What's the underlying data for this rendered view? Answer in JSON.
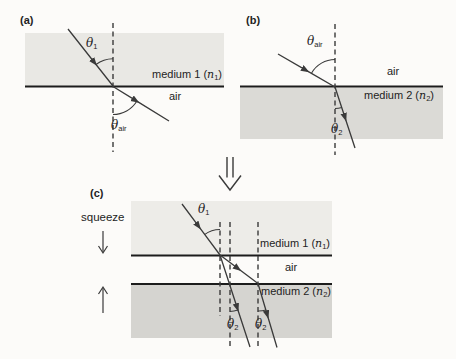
{
  "panel_a": {
    "label": "(a)",
    "theta1": {
      "sym": "θ",
      "sub": "1"
    },
    "theta_air": {
      "sym": "θ",
      "sub": "air"
    },
    "medium1": {
      "pre": "medium 1 (",
      "n": "n",
      "sub": "1",
      "post": ")"
    },
    "air": "air"
  },
  "panel_b": {
    "label": "(b)",
    "theta_air": {
      "sym": "θ",
      "sub": "air"
    },
    "theta2": {
      "sym": "θ",
      "sub": "2"
    },
    "medium2": {
      "pre": "medium 2 (",
      "n": "n",
      "sub": "2",
      "post": ")"
    },
    "air": "air"
  },
  "panel_c": {
    "label": "(c)",
    "squeeze": "squeeze",
    "theta1": {
      "sym": "θ",
      "sub": "1"
    },
    "theta2_left": {
      "sym": "θ",
      "sub": "2"
    },
    "theta2_right": {
      "sym": "θ",
      "sub": "2"
    },
    "medium1": {
      "pre": "medium 1 (",
      "n": "n",
      "sub": "1",
      "post": ")"
    },
    "medium2": {
      "pre": "medium 2 (",
      "n": "n",
      "sub": "2",
      "post": ")"
    },
    "air": "air"
  },
  "colors": {
    "background": "#fcfbf9",
    "medium1_a": "#e9e8e4",
    "medium2_b": "#dbdad6",
    "medium1_c": "#edece8",
    "medium2_c": "#d5d4d0",
    "line": "#1c1c1c",
    "ray": "#3a3a3a"
  }
}
